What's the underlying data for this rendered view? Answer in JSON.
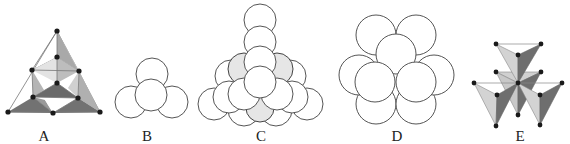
{
  "figure": {
    "panels": [
      {
        "id": "A",
        "label": "A",
        "description": "tetrahedral framework of corner-sharing tetrahedra with black vertex nodes"
      },
      {
        "id": "B",
        "label": "B",
        "description": "four spheres in a tetrahedral cluster"
      },
      {
        "id": "C",
        "label": "C",
        "description": "tetrahedral stack of close-packed spheres, some shaded"
      },
      {
        "id": "D",
        "label": "D",
        "description": "cluster of nine close-packed spheres"
      },
      {
        "id": "E",
        "label": "E",
        "description": "five tetrahedra sharing a common vertex"
      }
    ]
  },
  "colors": {
    "background": "#ffffff",
    "dark_face": "#6e6e6e",
    "mid_face": "#a6a6a6",
    "light_face": "#d4d4d4",
    "node": "#1a1a1a",
    "sphere_shade": "#e6e6e6",
    "outline": "#555555"
  }
}
